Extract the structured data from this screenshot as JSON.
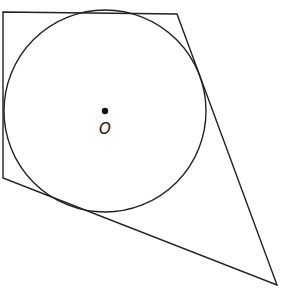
{
  "diagram": {
    "type": "circle inscribed in quadrilateral",
    "stroke_color": "#222222",
    "background": "#ffffff",
    "quadrilateral": {
      "vertices": [
        [
          3,
          12
        ],
        [
          177,
          14
        ],
        [
          277,
          285
        ],
        [
          3,
          178
        ]
      ]
    },
    "circle": {
      "center": [
        105,
        111
      ],
      "radius": 101
    },
    "center_point": {
      "label": "O",
      "position": [
        105,
        111
      ]
    }
  }
}
